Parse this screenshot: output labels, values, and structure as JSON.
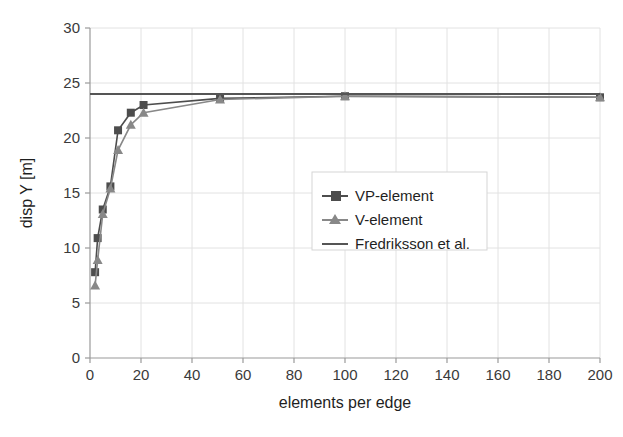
{
  "chart_data": {
    "type": "line",
    "title": "",
    "xlabel": "elements per edge",
    "ylabel": "disp Y [m]",
    "xlim": [
      0,
      200
    ],
    "ylim": [
      0,
      30
    ],
    "xticks": [
      0,
      20,
      40,
      60,
      80,
      100,
      120,
      140,
      160,
      180,
      200
    ],
    "yticks": [
      0,
      5,
      10,
      15,
      20,
      25,
      30
    ],
    "grid": true,
    "legend_position": "center-right",
    "series": [
      {
        "name": "VP-element",
        "marker": "square",
        "color": "#4d4d4d",
        "x": [
          2,
          3,
          5,
          8,
          11,
          16,
          21,
          51,
          100,
          200
        ],
        "y": [
          7.8,
          10.9,
          13.5,
          15.6,
          20.7,
          22.3,
          23.0,
          23.6,
          23.8,
          23.7
        ]
      },
      {
        "name": "V-element",
        "marker": "triangle",
        "color": "#888888",
        "x": [
          2,
          3,
          5,
          8,
          11,
          16,
          21,
          51,
          100,
          200
        ],
        "y": [
          6.6,
          8.9,
          13.1,
          15.4,
          18.9,
          21.2,
          22.3,
          23.5,
          23.8,
          23.7
        ]
      },
      {
        "name": "Fredriksson et al.",
        "marker": "none",
        "color": "#555555",
        "x": [
          0,
          200
        ],
        "y": [
          24.0,
          24.0
        ]
      }
    ]
  },
  "axes": {
    "x_tick_labels": [
      "0",
      "20",
      "40",
      "60",
      "80",
      "100",
      "120",
      "140",
      "160",
      "180",
      "200"
    ],
    "y_tick_labels": [
      "0",
      "5",
      "10",
      "15",
      "20",
      "25",
      "30"
    ],
    "x_axis_title": "elements per edge",
    "y_axis_title": "disp Y [m]"
  },
  "legend": {
    "entries": [
      {
        "label": "VP-element",
        "marker": "square-marker-icon"
      },
      {
        "label": "V-element",
        "marker": "triangle-marker-icon"
      },
      {
        "label": "Fredriksson et al.",
        "marker": "line-marker-icon"
      }
    ]
  },
  "colors": {
    "background": "#ffffff",
    "grid": "#e2e2e2",
    "axis": "#9a9a9a",
    "series_vp": "#4d4d4d",
    "series_v": "#888888",
    "series_reference": "#555555",
    "text": "#1f1f1f"
  }
}
